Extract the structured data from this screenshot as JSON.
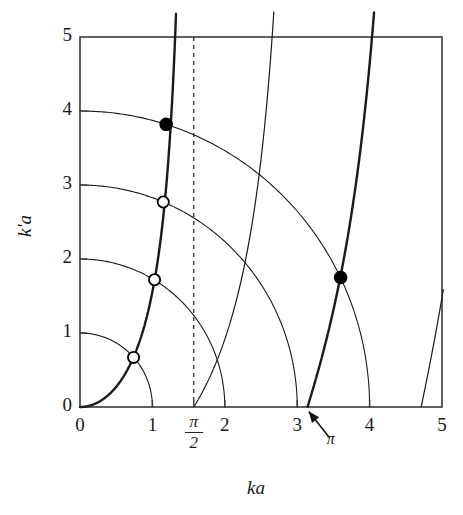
{
  "figure": {
    "background": "#ffffff",
    "axis_color": "#3a3a3a",
    "curve_color": "#1a1a1a",
    "marker_fill": "#000000",
    "marker_open_fill": "#ffffff"
  },
  "axes": {
    "x_title": "ka",
    "y_title": "k'a",
    "x_ticks": [
      "0",
      "1",
      "2",
      "3",
      "4",
      "5"
    ],
    "y_ticks": [
      "0",
      "1",
      "2",
      "3",
      "4",
      "5"
    ],
    "x_tick_values": [
      0,
      1,
      2,
      3,
      4,
      5
    ],
    "y_tick_values": [
      0,
      1,
      2,
      3,
      4,
      5
    ],
    "xlim": [
      0,
      5
    ],
    "ylim": [
      0,
      5
    ]
  },
  "annotations": {
    "half_pi_numerator": "π",
    "half_pi_denominator": "2",
    "half_pi_value": 1.5708,
    "pi_label": "π",
    "pi_value": 3.1416,
    "arrow_from": [
      3.45,
      -0.42
    ],
    "arrow_to": [
      3.16,
      -0.06
    ]
  },
  "chart_data": {
    "type": "line",
    "title": "",
    "xlabel": "ka",
    "ylabel": "k'a",
    "xlim": [
      0,
      5
    ],
    "ylim": [
      0,
      5
    ],
    "grid": false,
    "legend": "none",
    "series": [
      {
        "name": "circle-radius-1",
        "kind": "arc",
        "radius": 1,
        "style": "thin",
        "description": "quarter circle (ka)^2+(k'a)^2 = 1"
      },
      {
        "name": "circle-radius-2",
        "kind": "arc",
        "radius": 2,
        "style": "thin",
        "description": "quarter circle (ka)^2+(k'a)^2 = 4"
      },
      {
        "name": "circle-radius-3",
        "kind": "arc",
        "radius": 3,
        "style": "thin",
        "description": "quarter circle (ka)^2+(k'a)^2 = 9"
      },
      {
        "name": "circle-radius-4",
        "kind": "arc",
        "radius": 4,
        "style": "thin",
        "description": "quarter circle (ka)^2+(k'a)^2 = 16"
      },
      {
        "name": "even-branch-0",
        "kind": "tan",
        "style": "thick",
        "branch": 0,
        "description": "k'a = ka * tan(ka), branch 0 to pi/2"
      },
      {
        "name": "even-branch-1",
        "kind": "tan",
        "style": "thick",
        "branch": 1,
        "description": "k'a = ka * tan(ka), branch pi to 3pi/2"
      },
      {
        "name": "odd-branch-1",
        "kind": "cot",
        "style": "thin",
        "branch": 1,
        "description": "k'a = -ka * cot(ka), branch pi/2 to pi"
      },
      {
        "name": "odd-branch-2",
        "kind": "cot",
        "style": "thin",
        "branch": 2,
        "description": "k'a = -ka * cot(ka), branch 3pi/2 to 2pi"
      }
    ],
    "markers": [
      {
        "name": "bound-state-1",
        "x": 0.74,
        "y": 0.67,
        "fill": "open",
        "on_circle": 1
      },
      {
        "name": "bound-state-2",
        "x": 1.03,
        "y": 1.72,
        "fill": "open",
        "on_circle": 2
      },
      {
        "name": "bound-state-3",
        "x": 1.15,
        "y": 2.77,
        "fill": "open",
        "on_circle": 3
      },
      {
        "name": "bound-state-4",
        "x": 1.19,
        "y": 3.82,
        "fill": "solid",
        "on_circle": 4
      },
      {
        "name": "bound-state-5",
        "x": 3.6,
        "y": 1.75,
        "fill": "solid",
        "on_circle": 4
      }
    ]
  }
}
